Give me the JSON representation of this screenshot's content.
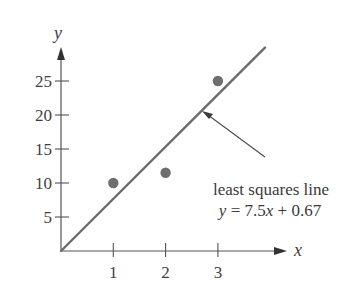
{
  "chart_data": {
    "type": "scatter",
    "title": "",
    "xlabel": "x",
    "ylabel": "y",
    "x_ticks": [
      1,
      2,
      3
    ],
    "y_ticks": [
      5,
      10,
      15,
      20,
      25
    ],
    "xlim": [
      0,
      3.9
    ],
    "ylim": [
      0,
      28
    ],
    "grid": false,
    "series": [
      {
        "name": "data points",
        "type": "scatter",
        "x": [
          1,
          2,
          3
        ],
        "y": [
          10,
          11.5,
          25
        ]
      },
      {
        "name": "least squares line",
        "type": "line",
        "equation": "y = 7.5x + 0.67",
        "slope": 7.5,
        "intercept": 0.67,
        "x_range": [
          0,
          3.9
        ]
      }
    ],
    "annotations": [
      {
        "text_line1": "least squares line",
        "text_line2_parts": [
          "y",
          " = 7.5",
          "x",
          " + 0.67"
        ],
        "points_to": "least squares line"
      }
    ]
  },
  "colors": {
    "axis": "#555555",
    "line": "#6b6b6b",
    "point": "#6e6e6e",
    "text": "#3a3a3a"
  }
}
